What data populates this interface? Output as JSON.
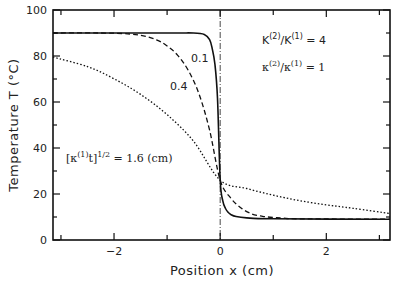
{
  "chart_data": {
    "type": "line",
    "title": "",
    "xlabel": "Position  x  (cm)",
    "ylabel": "Temperature  T  (°C)",
    "xlim": [
      -3.15,
      3.2
    ],
    "ylim": [
      0,
      100
    ],
    "x_ticks": [
      -2,
      0,
      2
    ],
    "x_tick_labels": [
      "−2",
      "0",
      "2"
    ],
    "y_ticks": [
      0,
      20,
      40,
      60,
      80,
      100
    ],
    "y_tick_labels": [
      "0",
      "20",
      "40",
      "60",
      "80",
      "100"
    ],
    "grid": false,
    "interface_x": 0,
    "interface_line_style": "dash-dot",
    "initial_temperatures": {
      "left": 90,
      "right": 10
    },
    "interface_temperature": 26,
    "series": [
      {
        "name": "0.1",
        "param": 0.1,
        "style": "solid",
        "x": [
          -3.15,
          -1.0,
          -0.5,
          -0.3,
          -0.2,
          -0.15,
          -0.1,
          -0.05,
          0,
          0.05,
          0.1,
          0.15,
          0.2,
          0.3,
          0.5,
          1.0,
          3.2
        ],
        "y": [
          90,
          90,
          90,
          89.4,
          87.1,
          83.2,
          76.5,
          61.6,
          26,
          17.0,
          13.7,
          12.1,
          11.1,
          10.2,
          9.6,
          9.2,
          9.0
        ]
      },
      {
        "name": "0.4",
        "param": 0.4,
        "style": "dashed",
        "x": [
          -3.15,
          -2.0,
          -1.5,
          -1.2,
          -1.0,
          -0.8,
          -0.6,
          -0.4,
          -0.2,
          0,
          0.2,
          0.4,
          0.6,
          0.8,
          1.0,
          1.2,
          1.5,
          3.2
        ],
        "y": [
          90,
          89.9,
          89.0,
          87.0,
          84.4,
          80.3,
          73.7,
          63.6,
          47.8,
          26,
          18.2,
          13.8,
          11.3,
          10.3,
          9.8,
          9.5,
          9.2,
          9.0
        ]
      },
      {
        "name": "1.6",
        "param": 1.6,
        "style": "dotted",
        "x": [
          -3.15,
          -2.5,
          -2.0,
          -1.5,
          -1.0,
          -0.5,
          0,
          0.5,
          1.0,
          1.5,
          2.0,
          2.5,
          3.2
        ],
        "y": [
          79.5,
          75.4,
          70.1,
          63.3,
          54.5,
          42.9,
          26,
          22.4,
          19.5,
          17.1,
          15.3,
          13.8,
          11.5
        ]
      }
    ],
    "annotations": [
      {
        "text": "K(2)/K(1) = 4"
      },
      {
        "text": "κ(2)/κ(1) = 1"
      },
      {
        "text": "[κ(1)t]1/2 = 1.6 (cm)"
      },
      {
        "text": "0.1"
      },
      {
        "text": "0.4"
      }
    ]
  },
  "labels": {
    "xlabel": "Position  x  (cm)",
    "ylabel": "Temperature  T  (°C)",
    "curve_01": "0.1",
    "curve_04": "0.4",
    "ratio_K": {
      "base": "K",
      "sup1": "(2)",
      "mid": "/K",
      "sup2": "(1)",
      "rhs": " = 4"
    },
    "ratio_kappa": {
      "base": "κ",
      "sup1": "(2)",
      "mid": "/κ",
      "sup2": "(1)",
      "rhs": " = 1"
    },
    "param": {
      "open": "[κ",
      "sup1": "(1)",
      "t": "t]",
      "sup2": "1/2",
      "rhs": " = 1.6 (cm)"
    }
  }
}
